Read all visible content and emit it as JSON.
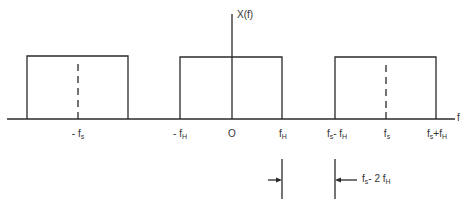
{
  "diagram": {
    "type": "spectrum-sampling-diagram",
    "y_axis_label": "X(f)",
    "x_axis_label": "f",
    "colors": {
      "line": "#2a2a2a",
      "background": "#ffffff"
    },
    "spectra": [
      {
        "name": "image-negative-fs",
        "left_edge": "-fs - fH",
        "center": "-fs",
        "right_edge": "-fs + fH",
        "center_dashed": true
      },
      {
        "name": "baseband",
        "left_edge": "-fH",
        "center": "0",
        "right_edge": "fH",
        "center_dashed": false
      },
      {
        "name": "image-positive-fs",
        "left_edge": "fs - fH",
        "center": "fs",
        "right_edge": "fs + fH",
        "center_dashed": true
      }
    ],
    "tick_labels": [
      {
        "id": "neg-fs",
        "base": "- f",
        "sub": "s",
        "suffix": "",
        "suffix_sub": ""
      },
      {
        "id": "neg-fh",
        "base": "- f",
        "sub": "H",
        "suffix": "",
        "suffix_sub": ""
      },
      {
        "id": "zero",
        "base": "O",
        "sub": "",
        "suffix": "",
        "suffix_sub": ""
      },
      {
        "id": "fh",
        "base": "f",
        "sub": "H",
        "suffix": "",
        "suffix_sub": ""
      },
      {
        "id": "fs-minus-fh",
        "base": "f",
        "sub": "s",
        "suffix": "- f",
        "suffix_sub": "H"
      },
      {
        "id": "fs",
        "base": "f",
        "sub": "s",
        "suffix": "",
        "suffix_sub": ""
      },
      {
        "id": "fs-plus-fh",
        "base": "f",
        "sub": "s",
        "suffix": "+f",
        "suffix_sub": "H"
      }
    ],
    "gap_annotation": {
      "base": "f",
      "sub": "s",
      "middle": "- 2 f",
      "middle_sub": "H",
      "description": "guard band between fH and fs - fH"
    }
  }
}
